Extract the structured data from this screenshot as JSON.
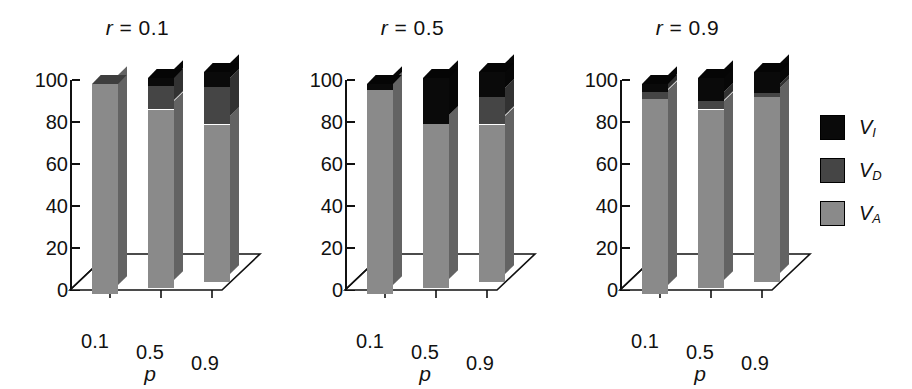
{
  "figure": {
    "caption": "",
    "legend": {
      "items": [
        {
          "label": "V",
          "sub": "I",
          "color": "#0a0a0a",
          "name": "V_I"
        },
        {
          "label": "V",
          "sub": "D",
          "color": "#454545",
          "name": "V_D"
        },
        {
          "label": "V",
          "sub": "A",
          "color": "#8a8a8a",
          "name": "V_A"
        }
      ]
    }
  },
  "chart_data": {
    "type": "bar",
    "title": "",
    "subtitle": "",
    "stacked": true,
    "three_d": true,
    "xlabel": "p",
    "ylabel": "",
    "ylim": [
      0,
      100
    ],
    "yticks": [
      0,
      20,
      40,
      60,
      80,
      100
    ],
    "ytick_labels": [
      "0",
      "20",
      "40",
      "60",
      "80",
      "100"
    ],
    "grid": false,
    "legend_position": "right",
    "legend_entries": [
      "V_I",
      "V_D",
      "V_A"
    ],
    "series": [
      {
        "name": "V_A",
        "color": "#8a8a8a"
      },
      {
        "name": "V_D",
        "color": "#454545"
      },
      {
        "name": "V_I",
        "color": "#0a0a0a"
      }
    ],
    "panels": [
      {
        "title": "r = 0.1",
        "title_var": "r",
        "title_value": "0.1",
        "categories": [
          "0.1",
          "0.5",
          "0.9"
        ],
        "values": {
          "V_A": [
            100,
            85,
            75
          ],
          "V_D": [
            0,
            11,
            18
          ],
          "V_I": [
            0,
            4,
            7
          ]
        }
      },
      {
        "title": "r = 0.5",
        "title_var": "r",
        "title_value": "0.5",
        "categories": [
          "0.1",
          "0.5",
          "0.9"
        ],
        "values": {
          "V_A": [
            97,
            78,
            75
          ],
          "V_D": [
            0,
            0,
            13
          ],
          "V_I": [
            3,
            22,
            12
          ]
        }
      },
      {
        "title": "r = 0.9",
        "title_var": "r",
        "title_value": "0.9",
        "categories": [
          "0.1",
          "0.5",
          "0.9"
        ],
        "values": {
          "V_A": [
            93,
            85,
            88
          ],
          "V_D": [
            3,
            4,
            2
          ],
          "V_I": [
            4,
            11,
            10
          ]
        }
      }
    ]
  }
}
